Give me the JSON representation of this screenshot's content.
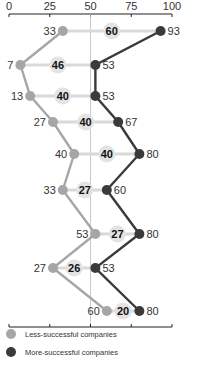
{
  "chart_data": {
    "type": "line",
    "orientation": "horizontal-dumbbell",
    "title": "",
    "xlabel": "",
    "ylabel": "",
    "xlim": [
      0,
      100
    ],
    "x_ticks": [
      0,
      25,
      50,
      75,
      100
    ],
    "reference_line": 50,
    "grid": false,
    "legend_position": "bottom",
    "rows": 9,
    "series": [
      {
        "name": "Less-successful companies",
        "color": "#a6a6a6",
        "values": [
          33,
          7,
          13,
          27,
          40,
          33,
          53,
          27,
          60
        ]
      },
      {
        "name": "More-successful companies",
        "color": "#3a3a3a",
        "values": [
          93,
          53,
          53,
          67,
          80,
          60,
          80,
          53,
          80
        ]
      }
    ],
    "gaps": [
      60,
      46,
      40,
      40,
      40,
      27,
      27,
      26,
      20
    ]
  },
  "legend": {
    "items": [
      {
        "label": "Less-successful companies",
        "color": "#a6a6a6"
      },
      {
        "label": "More-successful companies",
        "color": "#3a3a3a"
      }
    ]
  },
  "colors": {
    "connector": "#d9d9d9",
    "gap_badge": "#e3e3e3",
    "axis": "#222222",
    "reference": "#bdbdbd"
  }
}
